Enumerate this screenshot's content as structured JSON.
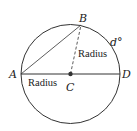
{
  "diagram": {
    "points": {
      "A": "A",
      "B": "B",
      "C": "C",
      "D": "D"
    },
    "arc_label": "d°",
    "segment_labels": {
      "CB": "Radius",
      "AC": "Radius"
    },
    "colors": {
      "stroke": "#333333",
      "background": "#ffffff"
    }
  }
}
